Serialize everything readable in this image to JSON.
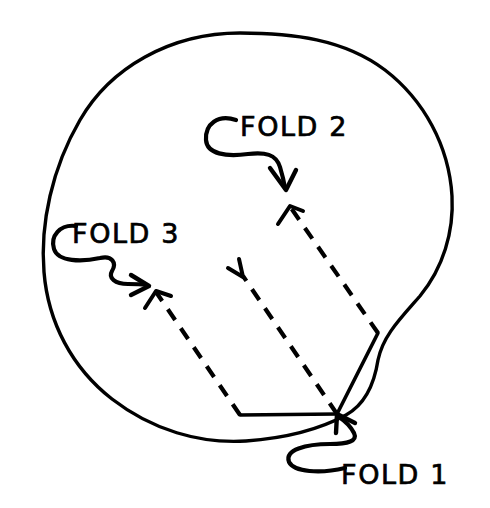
{
  "figure": {
    "kind": "hand-drawn-folding-diagram",
    "background_color": "#ffffff",
    "ink_color": "#000000",
    "labels": [
      {
        "id": "fold-2",
        "text": "FOLD 2",
        "x": 240,
        "y": 136
      },
      {
        "id": "fold-3",
        "text": "FOLD 3",
        "x": 72,
        "y": 243
      },
      {
        "id": "fold-1",
        "text": "FOLD 1",
        "x": 341,
        "y": 484
      }
    ],
    "blob_outline": {
      "name": "rounded-blob-outline",
      "path": "M 240 33 C 170 33 110 68 80 120 C 52 168 40 224 44 272 C 48 322 72 368 112 399 C 152 430 200 444 246 441 C 288 438 322 428 346 415 C 364 405 374 386 378 360 C 383 336 399 320 420 296 C 443 268 454 232 452 196 C 449 146 424 100 385 70 C 344 39 292 33 240 33 Z"
    },
    "solid_creases": [
      {
        "name": "crease-right-edge-to-corner",
        "path": "M 378 333 L 337 414"
      },
      {
        "name": "crease-bottom-to-corner",
        "path": "M 240 415 L 337 414"
      }
    ],
    "dashed_fold_lines": [
      {
        "name": "fold-1-dashed-center",
        "from": [
          337,
          414
        ],
        "to": [
          243,
          276
        ]
      },
      {
        "name": "fold-2-dashed-right",
        "from": [
          378,
          333
        ],
        "to": [
          291,
          208
        ]
      },
      {
        "name": "fold-3-dashed-left",
        "from": [
          240,
          415
        ],
        "to": [
          156,
          292
        ]
      }
    ],
    "dashed_arrowheads": [
      {
        "name": "fold-1-arrowhead",
        "path": "M 228 268 L 243 277 L 239 259"
      },
      {
        "name": "fold-2-arrowhead",
        "path": "M 278 224 L 290 206 L 303 211"
      },
      {
        "name": "fold-3-arrowhead",
        "path": "M 145 308 L 156 291 L 171 296"
      }
    ],
    "pointers": [
      {
        "name": "fold-2-pointer",
        "curve": "M 236 120 C 218 114 205 124 206 140 C 207 154 226 157 248 154 C 265 152 276 154 280 167 C 283 177 284 182 285 188",
        "head": "M 270 168 L 286 190 L 296 170"
      },
      {
        "name": "fold-3-pointer",
        "curve": "M 76 226 C 60 224 50 236 54 249 C 58 262 82 262 100 258 C 112 255 117 263 112 271 C 108 278 115 284 128 284 C 136 284 140 284 146 285",
        "head": "M 131 275 L 149 286 L 131 295"
      },
      {
        "name": "fold-1-pointer",
        "curve": "M 345 468 C 320 474 294 472 289 462 C 284 450 306 444 330 444 C 348 444 358 441 354 433 C 350 425 345 421 339 417",
        "head": "M 336 433 L 337 414 L 355 423"
      }
    ],
    "inner_outline_notch": {
      "name": "blob-bottom-notch",
      "path": "M 246 441 C 270 440 305 430 337 414"
    }
  }
}
